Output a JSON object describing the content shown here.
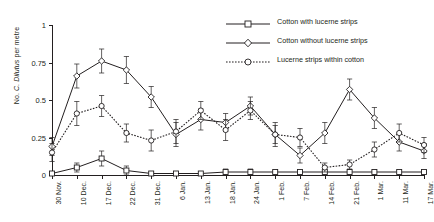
{
  "chart_data": {
    "type": "line",
    "title": "",
    "xlabel": "",
    "ylabel": "No. C. Dilutus per metre",
    "ylabel_prefix": "No. ",
    "ylabel_species": "C. Dilutus",
    "ylabel_suffix": " per metre",
    "ylim": [
      0,
      1
    ],
    "yticks": [
      0,
      0.25,
      0.5,
      0.75,
      1
    ],
    "ytick_labels": [
      "0",
      "0.25",
      "0.5",
      "0.75",
      "1"
    ],
    "grid": false,
    "legend_position": "top-right",
    "error_bars": true,
    "categories": [
      "30 Nov.",
      "10 Dec.",
      "17 Dec.",
      "22 Dec.",
      "31 Dec.",
      "6 Jan.",
      "13 Jan.",
      "18 Jan.",
      "24 Jan.",
      "1 Feb.",
      "7 Feb.",
      "14 Feb.",
      "21 Feb.",
      "1 Mar.",
      "11 Mar.",
      "17 Mar."
    ],
    "series": [
      {
        "name": "Cotton with lucerne strips",
        "marker": "square",
        "line_style": "solid",
        "color": "#231f20",
        "values": [
          0.01,
          0.05,
          0.11,
          0.03,
          0.01,
          0.01,
          0.01,
          0.02,
          0.02,
          0.02,
          0.02,
          0.02,
          0.02,
          0.02,
          0.02,
          0.02
        ],
        "err": [
          0.01,
          0.03,
          0.05,
          0.03,
          0.01,
          0.01,
          0.01,
          0.02,
          0.02,
          0.01,
          0.01,
          0.01,
          0.01,
          0.01,
          0.01,
          0.01
        ]
      },
      {
        "name": "Cotton without lucerne strips",
        "marker": "diamond",
        "line_style": "solid",
        "color": "#231f20",
        "values": [
          0.19,
          0.66,
          0.76,
          0.7,
          0.52,
          0.27,
          0.37,
          0.35,
          0.46,
          0.27,
          0.13,
          0.28,
          0.57,
          0.38,
          0.22,
          0.16
        ],
        "err": [
          0.06,
          0.08,
          0.08,
          0.09,
          0.07,
          0.08,
          0.07,
          0.06,
          0.06,
          0.08,
          0.05,
          0.07,
          0.07,
          0.07,
          0.06,
          0.05
        ]
      },
      {
        "name": "Lucerne strips within cotton",
        "marker": "circle",
        "line_style": "dotted",
        "color": "#231f20",
        "values": [
          0.15,
          0.41,
          0.46,
          0.28,
          0.23,
          0.29,
          0.43,
          0.3,
          0.43,
          0.27,
          0.25,
          0.05,
          0.07,
          0.17,
          0.28,
          0.2
        ],
        "err": [
          0.06,
          0.08,
          0.07,
          0.06,
          0.07,
          0.08,
          0.06,
          0.07,
          0.06,
          0.06,
          0.06,
          0.03,
          0.03,
          0.05,
          0.06,
          0.05
        ]
      }
    ]
  },
  "legend": {
    "items": [
      {
        "label": "Cotton with lucerne strips",
        "marker": "square",
        "line_style": "solid"
      },
      {
        "label": "Cotton without lucerne strips",
        "marker": "diamond",
        "line_style": "solid"
      },
      {
        "label": "Lucerne strips within cotton",
        "marker": "circle",
        "line_style": "dotted"
      }
    ]
  }
}
